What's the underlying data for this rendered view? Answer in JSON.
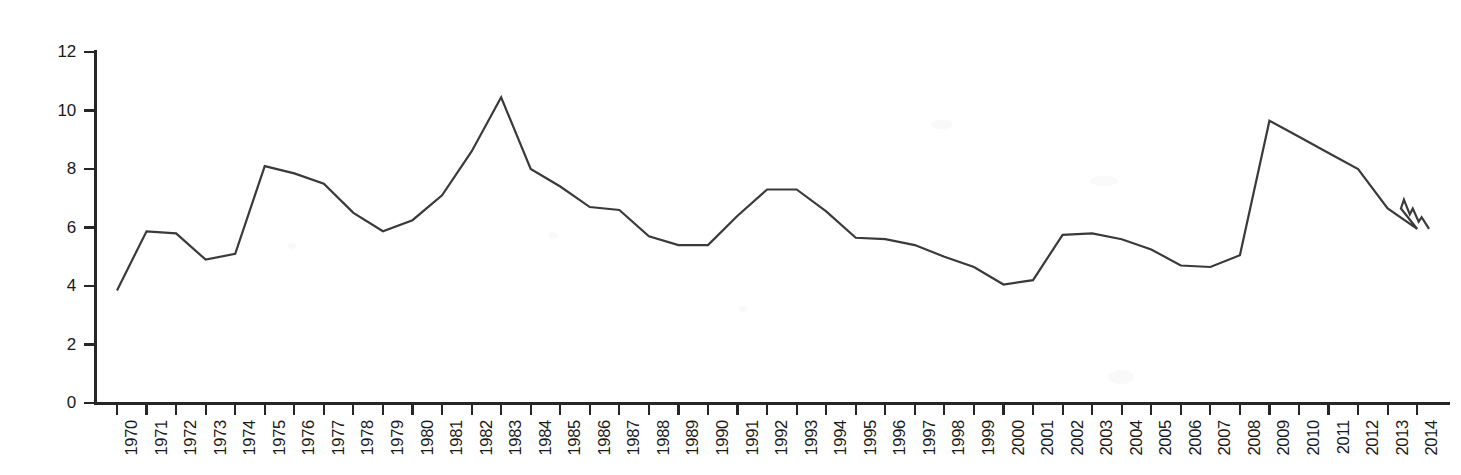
{
  "chart_data": {
    "type": "line",
    "title": "",
    "subtitle": "",
    "xlabel": "",
    "ylabel": "",
    "xlim": [
      1970,
      2014.9
    ],
    "ylim": [
      0,
      12
    ],
    "grid": false,
    "legend": null,
    "y_ticks": [
      0,
      2,
      4,
      6,
      8,
      10,
      12
    ],
    "y_tick_labels": [
      "0",
      "2",
      "4",
      "6",
      "8",
      "10",
      "12"
    ],
    "categories": [
      "1970",
      "1971",
      "1972",
      "1973",
      "1974",
      "1975",
      "1976",
      "1977",
      "1978",
      "1979",
      "1980",
      "1981",
      "1982",
      "1983",
      "1984",
      "1985",
      "1986",
      "1987",
      "1988",
      "1989",
      "1990",
      "1991",
      "1992",
      "1993",
      "1994",
      "1995",
      "1996",
      "1997",
      "1998",
      "1999",
      "2000",
      "2001",
      "2002",
      "2003",
      "2004",
      "2005",
      "2006",
      "2007",
      "2008",
      "2009",
      "2010",
      "2011",
      "2012",
      "2013",
      "2014"
    ],
    "values": [
      3.85,
      5.87,
      5.8,
      4.9,
      5.1,
      8.1,
      7.85,
      7.5,
      6.5,
      5.87,
      6.25,
      7.1,
      8.6,
      10.45,
      8.0,
      7.4,
      6.7,
      6.6,
      5.7,
      5.4,
      5.4,
      6.4,
      7.3,
      7.3,
      6.55,
      5.65,
      5.6,
      5.4,
      5.0,
      4.65,
      4.05,
      4.2,
      5.75,
      5.8,
      5.6,
      5.25,
      4.7,
      4.65,
      5.05,
      9.65,
      9.1,
      8.55,
      8.0,
      6.65,
      5.95
    ],
    "series": [
      {
        "name": "",
        "values": [
          3.85,
          5.87,
          5.8,
          4.9,
          5.1,
          8.1,
          7.85,
          7.5,
          6.5,
          5.87,
          6.25,
          7.1,
          8.6,
          10.45,
          8.0,
          7.4,
          6.7,
          6.6,
          5.7,
          5.4,
          5.4,
          6.4,
          7.3,
          7.3,
          6.55,
          5.65,
          5.6,
          5.4,
          5.0,
          4.65,
          4.05,
          4.2,
          5.75,
          5.8,
          5.6,
          5.25,
          4.7,
          4.65,
          5.05,
          9.65,
          9.1,
          8.55,
          8.0,
          6.65,
          5.95
        ],
        "color": "#3a3a3a",
        "line_width": 2.2
      }
    ],
    "tail_detail": {
      "note": "sub-annual stepped segment after 2013",
      "x": [
        2013.0,
        2013.45,
        2013.55,
        2013.75,
        2013.85,
        2014.05,
        2014.15,
        2014.4
      ],
      "y": [
        6.65,
        6.65,
        6.95,
        6.45,
        6.65,
        6.2,
        6.35,
        5.95
      ]
    }
  },
  "axes": {
    "y_axis_name": "value-axis",
    "x_axis_name": "year-axis"
  }
}
